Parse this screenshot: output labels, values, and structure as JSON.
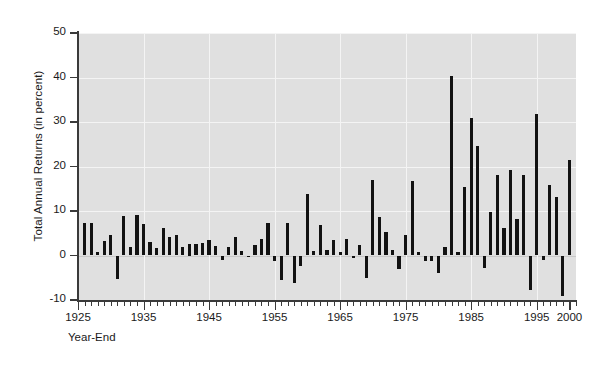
{
  "chart_data": {
    "type": "bar",
    "title": "",
    "subtitle": "",
    "xlabel": "Year-End",
    "ylabel": "Total Annual Returns (in percent)",
    "ylim": [
      -10,
      50
    ],
    "xlim": [
      1925,
      2001
    ],
    "yticks": [
      -10,
      0,
      10,
      20,
      30,
      40,
      50
    ],
    "ytick_labels": [
      "-10",
      "0",
      "10",
      "20",
      "30",
      "40",
      "50"
    ],
    "xticks": [
      1925,
      1935,
      1945,
      1955,
      1965,
      1975,
      1985,
      1995,
      2000
    ],
    "xtick_labels": [
      "1925",
      "1935",
      "1945",
      "1955",
      "1965",
      "1975",
      "1985",
      "1995",
      "2000"
    ],
    "xtick_minor_step": 1,
    "grid": true,
    "legend": null,
    "bar_color": "#121212",
    "plot_bg": "#e0e0e0",
    "page_bg": "#ffffff",
    "axis_color": "#3a3a3a",
    "grid_color": "#f4f4f4",
    "categories": [
      1926,
      1927,
      1928,
      1929,
      1930,
      1931,
      1932,
      1933,
      1934,
      1935,
      1936,
      1937,
      1938,
      1939,
      1940,
      1941,
      1942,
      1943,
      1944,
      1945,
      1946,
      1947,
      1948,
      1949,
      1950,
      1951,
      1952,
      1953,
      1954,
      1955,
      1956,
      1957,
      1958,
      1959,
      1960,
      1961,
      1962,
      1963,
      1964,
      1965,
      1966,
      1967,
      1968,
      1969,
      1970,
      1971,
      1972,
      1973,
      1974,
      1975,
      1976,
      1977,
      1978,
      1979,
      1980,
      1981,
      1982,
      1983,
      1984,
      1985,
      1986,
      1987,
      1988,
      1989,
      1990,
      1991,
      1992,
      1993,
      1994,
      1995,
      1996,
      1997,
      1998,
      1999,
      2000
    ],
    "values": [
      7.4,
      7.4,
      0.8,
      3.3,
      4.7,
      -5.3,
      8.8,
      1.8,
      9.0,
      7.0,
      3.1,
      1.6,
      6.2,
      4.2,
      4.5,
      2.0,
      2.5,
      2.6,
      2.7,
      3.4,
      2.1,
      -0.9,
      1.9,
      4.1,
      1.1,
      -0.3,
      2.3,
      3.6,
      7.2,
      -1.3,
      -5.6,
      7.4,
      -6.1,
      -2.3,
      13.8,
      0.9,
      6.9,
      1.2,
      3.5,
      0.7,
      3.6,
      -0.5,
      2.3,
      -5.1,
      16.9,
      8.7,
      5.2,
      1.2,
      -3.1,
      4.6,
      16.8,
      0.7,
      -1.2,
      -1.2,
      -4.0,
      1.9,
      40.4,
      0.7,
      15.4,
      31.0,
      24.5,
      -2.7,
      9.7,
      18.1,
      6.2,
      19.3,
      8.1,
      18.2,
      -7.8,
      31.7,
      -0.9,
      15.9,
      13.1,
      -9.0,
      21.5
    ],
    "note_series_description": "Annual total returns, bar chart, one bar per year 1926-2000"
  },
  "axis": {
    "y_title": "Total Annual Returns (in percent)",
    "x_title": "Year-End"
  }
}
